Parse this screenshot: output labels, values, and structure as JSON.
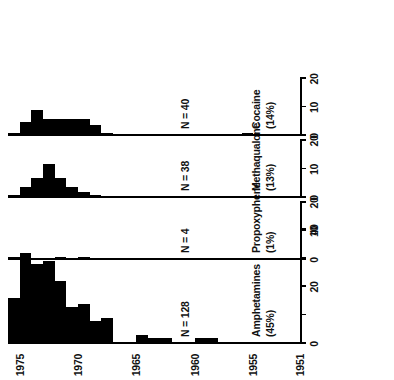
{
  "chart_data": {
    "type": "bar",
    "title": "",
    "subtitle": "",
    "xlabel": "",
    "ylabel": "",
    "orientation": "horizontal",
    "grid": false,
    "legend": null,
    "year_axis": {
      "label": "",
      "ticks": [
        1951,
        1955,
        1960,
        1965,
        1970,
        1975
      ],
      "range": [
        1951,
        1976
      ]
    },
    "panels": [
      {
        "name": "Amphetamines",
        "percent_label": "(45%)",
        "n_label": "N = 128",
        "n_value": 128,
        "value_axis": {
          "ticks": [
            0,
            10,
            20,
            30,
            40
          ],
          "tick_labels": [
            "0",
            "",
            "20",
            "",
            "40"
          ],
          "range": [
            0,
            40
          ]
        },
        "categories": [
          1951,
          1952,
          1953,
          1954,
          1955,
          1956,
          1957,
          1958,
          1959,
          1960,
          1961,
          1962,
          1963,
          1964,
          1965,
          1966,
          1967,
          1968,
          1969,
          1970,
          1971,
          1972,
          1973,
          1974,
          1975,
          1976
        ],
        "values": [
          0,
          0,
          0,
          0,
          0,
          0,
          0,
          0,
          2,
          2,
          0,
          0,
          2,
          2,
          3,
          0,
          0,
          9,
          8,
          14,
          13,
          22,
          29,
          28,
          32,
          16
        ]
      },
      {
        "name": "Propoxyphene",
        "percent_label": "(1%)",
        "n_label": "N = 4",
        "n_value": 4,
        "value_axis": {
          "ticks": [
            0,
            10,
            20
          ],
          "tick_labels": [
            "0",
            "10",
            "20"
          ],
          "range": [
            0,
            20
          ]
        },
        "categories": [
          1951,
          1952,
          1953,
          1954,
          1955,
          1956,
          1957,
          1958,
          1959,
          1960,
          1961,
          1962,
          1963,
          1964,
          1965,
          1966,
          1967,
          1968,
          1969,
          1970,
          1971,
          1972,
          1973,
          1974,
          1975,
          1976
        ],
        "values": [
          0,
          0,
          0,
          0,
          0,
          0,
          0,
          0,
          0,
          0,
          0,
          0,
          0,
          0,
          0,
          0,
          0,
          0,
          0,
          1,
          0,
          1,
          0,
          0,
          1,
          1
        ]
      },
      {
        "name": "Methaqualone",
        "percent_label": "(13%)",
        "n_label": "N = 38",
        "n_value": 38,
        "value_axis": {
          "ticks": [
            0,
            10,
            20
          ],
          "tick_labels": [
            "0",
            "10",
            "20"
          ],
          "range": [
            0,
            20
          ]
        },
        "categories": [
          1951,
          1952,
          1953,
          1954,
          1955,
          1956,
          1957,
          1958,
          1959,
          1960,
          1961,
          1962,
          1963,
          1964,
          1965,
          1966,
          1967,
          1968,
          1969,
          1970,
          1971,
          1972,
          1973,
          1974,
          1975,
          1976
        ],
        "values": [
          0,
          0,
          0,
          0,
          0,
          0,
          0,
          0,
          0,
          0,
          0,
          0,
          0,
          0,
          0,
          0,
          0,
          0,
          1,
          2,
          4,
          7,
          12,
          7,
          4,
          1
        ]
      },
      {
        "name": "Cocaine",
        "percent_label": "(14%)",
        "n_label": "N = 40",
        "n_value": 40,
        "value_axis": {
          "ticks": [
            0,
            10,
            20
          ],
          "tick_labels": [
            "0",
            "10",
            "20"
          ],
          "range": [
            0,
            20
          ]
        },
        "categories": [
          1951,
          1952,
          1953,
          1954,
          1955,
          1956,
          1957,
          1958,
          1959,
          1960,
          1961,
          1962,
          1963,
          1964,
          1965,
          1966,
          1967,
          1968,
          1969,
          1970,
          1971,
          1972,
          1973,
          1974,
          1975,
          1976
        ],
        "values": [
          0,
          0,
          0,
          0,
          0,
          1,
          0,
          0,
          0,
          0,
          0,
          0,
          0,
          0,
          0,
          0,
          0,
          1,
          4,
          6,
          6,
          6,
          6,
          9,
          5,
          1
        ]
      }
    ],
    "colors": {
      "bar": "#000000",
      "axis": "#000000",
      "background": "#ffffff"
    }
  }
}
